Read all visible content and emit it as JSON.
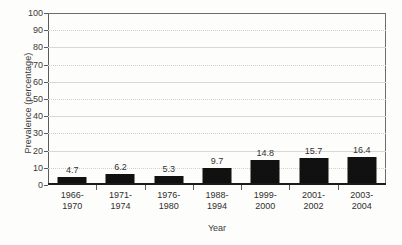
{
  "chart_data": {
    "type": "bar",
    "title": "",
    "xlabel": "Year",
    "ylabel": "Prevalence (percentage)",
    "categories": [
      "1966-1970",
      "1971-1974",
      "1976-1980",
      "1988-1994",
      "1999-2000",
      "2001-2002",
      "2003-2004"
    ],
    "category_lines": [
      [
        "1966-",
        "1970"
      ],
      [
        "1971-",
        "1974"
      ],
      [
        "1976-",
        "1980"
      ],
      [
        "1988-",
        "1994"
      ],
      [
        "1999-",
        "2000"
      ],
      [
        "2001-",
        "2002"
      ],
      [
        "2003-",
        "2004"
      ]
    ],
    "values": [
      4.7,
      6.2,
      5.3,
      9.7,
      14.8,
      15.7,
      16.4
    ],
    "value_labels": [
      "4.7",
      "6.2",
      "5.3",
      "9.7",
      "14.8",
      "15.7",
      "16.4"
    ],
    "ylim": [
      0,
      100
    ],
    "ytick_step": 10,
    "yticks": [
      100,
      90,
      80,
      70,
      60,
      50,
      40,
      30,
      20,
      10,
      0
    ],
    "ytick_labels": [
      "100",
      "90",
      "80",
      "70",
      "60",
      "50",
      "40",
      "30",
      "20",
      "10",
      "0"
    ],
    "grid": true,
    "legend": null,
    "bar_color": "#111111",
    "gridline_color": "#d8d8d8",
    "axis_color": "#1a1a1a",
    "background_color": "#fdfdfb"
  }
}
